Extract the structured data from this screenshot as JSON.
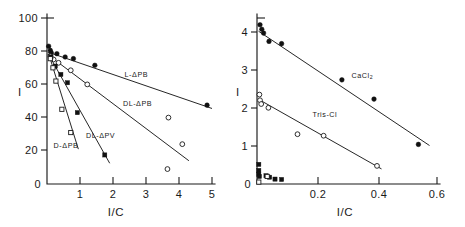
{
  "figure": {
    "title": "",
    "background": "#ffffff",
    "ink_color": "#1a1a1a"
  },
  "chart_data": [
    {
      "id": "left-panel",
      "type": "scatter",
      "title": "",
      "xlabel": "I/C",
      "ylabel": "I",
      "xlim": [
        0,
        5
      ],
      "ylim": [
        0,
        100
      ],
      "xticks": [
        0,
        1,
        2,
        3,
        4,
        5
      ],
      "xticklabels": [
        "0",
        "1",
        "2",
        "3",
        "4",
        "5"
      ],
      "yticks": [
        0,
        20,
        40,
        60,
        80,
        100
      ],
      "yticklabels": [
        "0",
        "20",
        "40",
        "60",
        "80",
        "100"
      ],
      "grid": false,
      "legend_position": "inline-annotation",
      "series": [
        {
          "name": "L-ΔPB",
          "label": "L-ΔPB",
          "marker": "filled-circle",
          "label_x": 2.35,
          "label_y": 64.5,
          "fit_line": {
            "x": [
              0.02,
              5.0
            ],
            "y": [
              79.5,
              45.5
            ]
          },
          "points": [
            {
              "x": 0.05,
              "y": 83.0
            },
            {
              "x": 0.1,
              "y": 80.5
            },
            {
              "x": 0.13,
              "y": 79.0
            },
            {
              "x": 0.3,
              "y": 78.5
            },
            {
              "x": 0.55,
              "y": 76.5
            },
            {
              "x": 0.8,
              "y": 75.5
            },
            {
              "x": 1.45,
              "y": 71.5
            },
            {
              "x": 4.85,
              "y": 47.5
            }
          ]
        },
        {
          "name": "DL-ΔPB",
          "label": "DL-ΔPB",
          "marker": "open-circle",
          "label_x": 2.3,
          "label_y": 47.0,
          "fit_line": {
            "x": [
              0.02,
              4.3
            ],
            "y": [
              78.0,
              14.0
            ]
          },
          "points": [
            {
              "x": 0.1,
              "y": 77.0
            },
            {
              "x": 0.2,
              "y": 75.0
            },
            {
              "x": 0.35,
              "y": 73.0
            },
            {
              "x": 0.72,
              "y": 68.5
            },
            {
              "x": 1.22,
              "y": 60.0
            },
            {
              "x": 3.68,
              "y": 40.0
            },
            {
              "x": 4.1,
              "y": 24.0
            },
            {
              "x": 3.65,
              "y": 9.0
            }
          ]
        },
        {
          "name": "DL-ΔPV",
          "label": "DL-ΔPV",
          "marker": "filled-square",
          "label_x": 1.18,
          "label_y": 27.5,
          "fit_line": {
            "x": [
              0.05,
              1.9
            ],
            "y": [
              78.0,
              12.5
            ]
          },
          "points": [
            {
              "x": 0.12,
              "y": 76.5
            },
            {
              "x": 0.25,
              "y": 71.0
            },
            {
              "x": 0.42,
              "y": 66.0
            },
            {
              "x": 0.62,
              "y": 61.0
            },
            {
              "x": 0.92,
              "y": 43.0
            },
            {
              "x": 1.75,
              "y": 17.5
            }
          ]
        },
        {
          "name": "D-ΔPB",
          "label": "D-ΔPB",
          "marker": "open-square",
          "label_x": 0.2,
          "label_y": 21.5,
          "fit_line": {
            "x": [
              0.05,
              0.95
            ],
            "y": [
              78.5,
              21.0
            ]
          },
          "points": [
            {
              "x": 0.1,
              "y": 75.5
            },
            {
              "x": 0.18,
              "y": 70.0
            },
            {
              "x": 0.27,
              "y": 62.0
            },
            {
              "x": 0.45,
              "y": 45.0
            },
            {
              "x": 0.72,
              "y": 31.0
            }
          ]
        }
      ]
    },
    {
      "id": "right-panel",
      "type": "scatter",
      "title": "",
      "xlabel": "I/C",
      "ylabel": "I",
      "xlim": [
        0,
        0.6
      ],
      "ylim": [
        0,
        4.4
      ],
      "xticks": [
        0,
        0.2,
        0.4,
        0.6
      ],
      "xticklabels": [
        "0",
        "0.2",
        "0.4",
        "0.6"
      ],
      "yticks": [
        0,
        1,
        2,
        3,
        4
      ],
      "yticklabels": [
        "0",
        "1",
        "2",
        "3",
        "4"
      ],
      "grid": false,
      "legend_position": "inline-annotation",
      "series": [
        {
          "name": "CaCl2",
          "label": "CaCl",
          "label_sub": "2",
          "marker": "filled-circle",
          "label_x": 0.315,
          "label_y": 2.82,
          "fit_line": {
            "x": [
              0.005,
              0.575
            ],
            "y": [
              4.05,
              1.02
            ]
          },
          "points": [
            {
              "x": 0.01,
              "y": 4.22
            },
            {
              "x": 0.016,
              "y": 4.1
            },
            {
              "x": 0.022,
              "y": 4.0
            },
            {
              "x": 0.04,
              "y": 3.78
            },
            {
              "x": 0.082,
              "y": 3.72
            },
            {
              "x": 0.283,
              "y": 2.76
            },
            {
              "x": 0.39,
              "y": 2.25
            },
            {
              "x": 0.538,
              "y": 1.05
            }
          ]
        },
        {
          "name": "Tris-Cl",
          "label": "Tris-Cl",
          "marker": "open-circle",
          "label_x": 0.185,
          "label_y": 1.78,
          "fit_line": {
            "x": [
              0.004,
              0.415
            ],
            "y": [
              2.25,
              0.4
            ]
          },
          "points": [
            {
              "x": 0.008,
              "y": 2.37
            },
            {
              "x": 0.01,
              "y": 2.22
            },
            {
              "x": 0.014,
              "y": 2.12
            },
            {
              "x": 0.038,
              "y": 2.02
            },
            {
              "x": 0.135,
              "y": 1.32
            },
            {
              "x": 0.222,
              "y": 1.28
            },
            {
              "x": 0.4,
              "y": 0.48
            }
          ]
        },
        {
          "name": "baseline-cluster",
          "label": "",
          "marker": "filled-square",
          "fit_line": null,
          "points": [
            {
              "x": 0.006,
              "y": 0.52
            },
            {
              "x": 0.006,
              "y": 0.36
            },
            {
              "x": 0.006,
              "y": 0.26
            },
            {
              "x": 0.008,
              "y": 0.2
            },
            {
              "x": 0.03,
              "y": 0.22
            },
            {
              "x": 0.042,
              "y": 0.18
            },
            {
              "x": 0.06,
              "y": 0.13
            },
            {
              "x": 0.082,
              "y": 0.12
            }
          ]
        },
        {
          "name": "baseline-cluster-open",
          "label": "",
          "marker": "open-square",
          "fit_line": null,
          "points": [
            {
              "x": 0.006,
              "y": 0.05
            },
            {
              "x": 0.034,
              "y": 0.2
            }
          ]
        }
      ]
    }
  ]
}
